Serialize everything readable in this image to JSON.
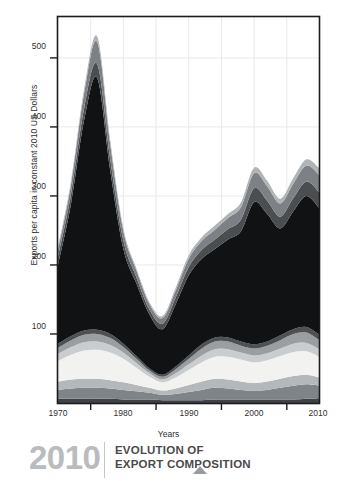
{
  "chart_data": {
    "type": "area",
    "stacked": true,
    "title": "",
    "xlabel": "Years",
    "ylabel": "Exports per capita in constant 2010 US Dollars",
    "xlim": [
      1970,
      2010
    ],
    "ylim": [
      0,
      560
    ],
    "grid": true,
    "legend_position": "none",
    "x_ticks": [
      1970,
      1980,
      1990,
      2000,
      2010
    ],
    "x_tick_labels": [
      "1970",
      "1980",
      "1990",
      "2000",
      "2010"
    ],
    "x_minor_ticks": [
      1975,
      1985,
      1995,
      2005
    ],
    "y_ticks": [
      100,
      200,
      300,
      400,
      500
    ],
    "y_tick_labels": [
      "100",
      "200",
      "300",
      "400",
      "500"
    ],
    "x": [
      1970,
      1972,
      1974,
      1976,
      1978,
      1980,
      1982,
      1984,
      1986,
      1988,
      1990,
      1992,
      1994,
      1996,
      1998,
      2000,
      2002,
      2004,
      2006,
      2008,
      2010
    ],
    "series": [
      {
        "name": "layer-1-bottom",
        "color": "#3f4347",
        "values": [
          6,
          6,
          6,
          6,
          6,
          5,
          5,
          5,
          4,
          4,
          4,
          4,
          5,
          5,
          5,
          5,
          5,
          5,
          5,
          6,
          7
        ]
      },
      {
        "name": "layer-2",
        "color": "#7e8488",
        "values": [
          13,
          15,
          16,
          16,
          15,
          14,
          12,
          10,
          8,
          9,
          12,
          15,
          17,
          16,
          14,
          13,
          14,
          17,
          20,
          21,
          18
        ]
      },
      {
        "name": "layer-3",
        "color": "#b4b8bb",
        "values": [
          12,
          13,
          13,
          13,
          12,
          11,
          9,
          7,
          6,
          8,
          10,
          12,
          13,
          13,
          12,
          11,
          12,
          13,
          14,
          14,
          12
        ]
      },
      {
        "name": "layer-4-light",
        "color": "#f2f2f0",
        "values": [
          30,
          36,
          41,
          42,
          40,
          34,
          25,
          16,
          12,
          16,
          22,
          28,
          32,
          33,
          32,
          30,
          31,
          33,
          35,
          34,
          30
        ]
      },
      {
        "name": "layer-5",
        "color": "#c9cdd0",
        "values": [
          10,
          11,
          12,
          12,
          11,
          9,
          7,
          5,
          4,
          6,
          8,
          10,
          11,
          11,
          10,
          10,
          10,
          11,
          12,
          12,
          11
        ]
      },
      {
        "name": "layer-6",
        "color": "#9a9ea1",
        "values": [
          9,
          10,
          11,
          11,
          10,
          8,
          6,
          4,
          4,
          6,
          8,
          10,
          11,
          11,
          10,
          10,
          11,
          12,
          14,
          15,
          13
        ]
      },
      {
        "name": "layer-7-dark",
        "color": "#4d5154",
        "values": [
          6,
          6,
          6,
          6,
          6,
          5,
          4,
          3,
          3,
          4,
          5,
          6,
          6,
          6,
          6,
          6,
          6,
          7,
          7,
          8,
          8
        ]
      },
      {
        "name": "layer-8-core",
        "color": "#111214",
        "values": [
          114,
          192,
          305,
          365,
          236,
          137,
          105,
          78,
          66,
          90,
          116,
          124,
          128,
          142,
          160,
          206,
          185,
          155,
          171,
          190,
          183
        ]
      },
      {
        "name": "layer-9",
        "color": "#4a4e51",
        "values": [
          12,
          14,
          17,
          20,
          16,
          12,
          9,
          7,
          8,
          10,
          12,
          13,
          14,
          15,
          17,
          20,
          19,
          17,
          19,
          21,
          23
        ]
      },
      {
        "name": "layer-10",
        "color": "#7d8185",
        "values": [
          10,
          14,
          22,
          32,
          22,
          14,
          10,
          8,
          8,
          10,
          12,
          13,
          14,
          16,
          18,
          22,
          21,
          19,
          21,
          23,
          25
        ]
      },
      {
        "name": "layer-11-top",
        "color": "#b0b4b7",
        "values": [
          4,
          5,
          6,
          8,
          6,
          4,
          3,
          3,
          3,
          4,
          5,
          5,
          6,
          6,
          7,
          8,
          8,
          7,
          8,
          9,
          10
        ]
      }
    ],
    "totals": [
      226,
      322,
      455,
      531,
      380,
      253,
      195,
      146,
      126,
      167,
      214,
      240,
      258,
      274,
      291,
      341,
      322,
      296,
      326,
      353,
      340
    ]
  },
  "axes": {
    "y_title": "Exports per capita in constant 2010 US Dollars",
    "x_title": "Years"
  },
  "footer": {
    "year": "2010",
    "title_line1": "EVOLUTION OF",
    "title_line2": "EXPORT COMPOSITION",
    "marker": "triangle-up"
  },
  "colors": {
    "plot_border": "#1c1c1c",
    "grid": "#e9e9e9",
    "text": "#2f2f2f",
    "footer_year": "#b9bcbe",
    "footer_title": "#4a4a4a",
    "footer_marker": "#9a9da0"
  }
}
